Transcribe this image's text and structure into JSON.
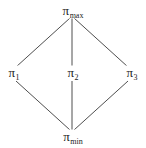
{
  "diagram": {
    "type": "hasse-lattice",
    "nodes": [
      {
        "id": "max",
        "symbol": "π",
        "subscript": "max",
        "x": 72,
        "y": 11
      },
      {
        "id": "p1",
        "symbol": "π",
        "subscript": "1",
        "x": 13,
        "y": 74
      },
      {
        "id": "p2",
        "symbol": "π",
        "subscript": "2",
        "x": 72,
        "y": 74
      },
      {
        "id": "p3",
        "symbol": "π",
        "subscript": "3",
        "x": 133,
        "y": 74
      },
      {
        "id": "min",
        "symbol": "π",
        "subscript": "min",
        "x": 72,
        "y": 137
      }
    ],
    "edges": [
      {
        "from": "max",
        "to": "p1"
      },
      {
        "from": "max",
        "to": "p2"
      },
      {
        "from": "max",
        "to": "p3"
      },
      {
        "from": "p1",
        "to": "min"
      },
      {
        "from": "p2",
        "to": "min"
      },
      {
        "from": "p3",
        "to": "min"
      }
    ]
  },
  "labels": {
    "max": {
      "symbol": "π",
      "sub": "max"
    },
    "p1": {
      "symbol": "π",
      "sub": "1"
    },
    "p2": {
      "symbol": "π",
      "sub": "2"
    },
    "p3": {
      "symbol": "π",
      "sub": "3"
    },
    "min": {
      "symbol": "π",
      "sub": "min"
    }
  },
  "colors": {
    "line": "#3a3a3a",
    "text": "#1a1a1a",
    "background": "#ffffff"
  }
}
